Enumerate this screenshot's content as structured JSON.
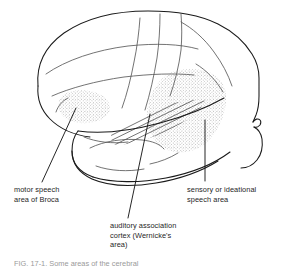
{
  "figure": {
    "view": "left lateral view of cerebrum",
    "background_color": "#ffffff",
    "outline_color": "#1a1a1a",
    "sulcus_color": "#555555",
    "stipple_color": "#8a8a8a",
    "leader_color": "#1a1a1a",
    "text_color": "#262626",
    "cut_off_caption": "FIG. 17-1. Some areas of the cerebral"
  },
  "labels": {
    "broca": {
      "name": "motor speech area of Broca",
      "lines": [
        "motor speech",
        "area of Broca"
      ]
    },
    "wernicke": {
      "name": "auditory association cortex (Wernicke's area)",
      "lines": [
        "auditory association",
        "cortex (Wernicke's",
        "area)"
      ]
    },
    "sensory": {
      "name": "sensory or ideational speech area",
      "lines": [
        "sensory or ideational",
        "speech area"
      ]
    }
  },
  "regions": [
    {
      "id": "broca-area",
      "label": "motor speech area of Broca",
      "fill": "stipple",
      "location": "inferior frontal gyrus, anterior-left"
    },
    {
      "id": "wernicke-sensory-area",
      "label": "sensory or ideational speech area",
      "fill": "stipple",
      "location": "posterior superior temporal / parietal, right"
    },
    {
      "id": "arcuate-fasciculus",
      "label": "auditory association fiber bundle",
      "fill": "hatch",
      "location": "along the sylvian fissure between the two stippled areas"
    }
  ]
}
